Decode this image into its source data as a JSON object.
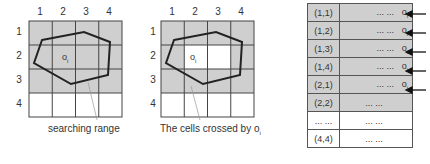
{
  "colors": {
    "filled": "#cfcfcf",
    "empty": "#ffffff",
    "line": "#333333"
  },
  "grid1": {
    "col_labels": [
      "1",
      "2",
      "3",
      "4"
    ],
    "row_labels": [
      "1",
      "2",
      "3",
      "4"
    ],
    "object_label": "o",
    "object_sub": "i",
    "caption": "searching range",
    "filled_cells": [
      [
        1,
        1
      ],
      [
        1,
        2
      ],
      [
        1,
        3
      ],
      [
        1,
        4
      ],
      [
        2,
        1
      ],
      [
        2,
        2
      ],
      [
        2,
        3
      ],
      [
        2,
        4
      ],
      [
        3,
        1
      ],
      [
        3,
        2
      ],
      [
        3,
        3
      ],
      [
        3,
        4
      ]
    ]
  },
  "grid2": {
    "col_labels": [
      "1",
      "2",
      "3",
      "4"
    ],
    "row_labels": [
      "1",
      "2",
      "3",
      "4"
    ],
    "object_label": "o",
    "object_sub": "i",
    "caption": "The cells crossed by o",
    "caption_sub": "i",
    "filled_cells": [
      [
        1,
        1
      ],
      [
        1,
        2
      ],
      [
        1,
        3
      ],
      [
        1,
        4
      ],
      [
        2,
        1
      ],
      [
        2,
        4
      ],
      [
        3,
        1
      ],
      [
        3,
        2
      ],
      [
        3,
        3
      ],
      [
        3,
        4
      ]
    ]
  },
  "table": {
    "rows": [
      {
        "key": "(1,1)",
        "value": "... ...",
        "obj": "o",
        "sub": "i",
        "filled": true,
        "arrow": true
      },
      {
        "key": "(1,2)",
        "value": "... ...",
        "obj": "o",
        "sub": "i",
        "filled": true,
        "arrow": true
      },
      {
        "key": "(1,3)",
        "value": "... ...",
        "obj": "o",
        "sub": "i",
        "filled": true,
        "arrow": true
      },
      {
        "key": "(1,4)",
        "value": "... ...",
        "obj": "o",
        "sub": "i",
        "filled": true,
        "arrow": true
      },
      {
        "key": "(2,1)",
        "value": "... ...",
        "obj": "o",
        "sub": "i",
        "filled": true,
        "arrow": true
      },
      {
        "key": "(2,2)",
        "value": "... ...",
        "obj": "",
        "sub": "",
        "filled": true,
        "arrow": false
      },
      {
        "key": "... ...",
        "value": "... ...",
        "obj": "",
        "sub": "",
        "filled": false,
        "arrow": false
      },
      {
        "key": "(4,4)",
        "value": "... ...",
        "obj": "",
        "sub": "",
        "filled": false,
        "arrow": false
      }
    ]
  }
}
